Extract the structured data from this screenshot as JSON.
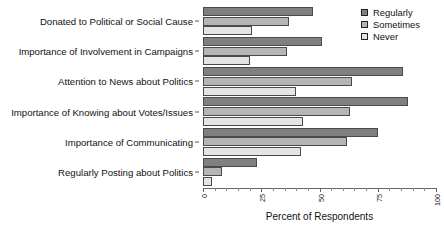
{
  "chart_data": {
    "type": "bar",
    "orientation": "horizontal",
    "title": "",
    "xlabel": "Percent of Respondents",
    "ylabel": "",
    "xlim": [
      0,
      100
    ],
    "xticks": [
      0,
      25,
      50,
      75,
      100
    ],
    "xtick_labels": [
      "0",
      "25",
      "50",
      "75",
      "100"
    ],
    "grid": false,
    "legend_position": "top-right",
    "categories": [
      "Donated to Political or Social Cause",
      "Importance of Involvement in Campaigns",
      "Attention to News about Politics",
      "Importance of Knowing about Votes/Issues",
      "Importance of Communicating",
      "Regularly Posting about Politics"
    ],
    "series": [
      {
        "name": "Regularly",
        "color": "#808080",
        "values": [
          47,
          51,
          86,
          88,
          75,
          23
        ]
      },
      {
        "name": "Sometimes",
        "color": "#b5b5b5",
        "values": [
          37,
          36,
          64,
          63,
          62,
          8
        ]
      },
      {
        "name": "Never",
        "color": "#e4e4e4",
        "values": [
          21,
          20,
          40,
          43,
          42,
          4
        ]
      }
    ]
  },
  "legend": {
    "items": [
      {
        "label": "Regularly",
        "swatch": "regularly"
      },
      {
        "label": "Sometimes",
        "swatch": "sometimes"
      },
      {
        "label": "Never",
        "swatch": "never"
      }
    ]
  },
  "axis": {
    "x_title": "Percent of Respondents"
  }
}
